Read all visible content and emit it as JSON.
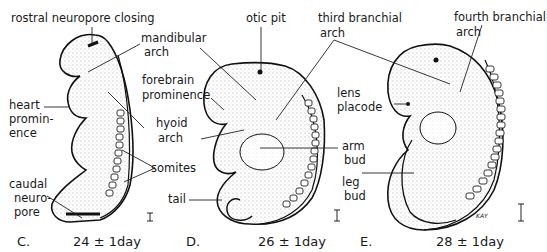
{
  "figure": {
    "panels": [
      {
        "id": "C",
        "letter": "C.",
        "age": "24 ± 1day",
        "labels": {
          "rostral_neuropore": "rostral neuropore closing",
          "mandibular_1": "mandibular",
          "mandibular_2": "arch",
          "forebrain_1": "forebrain",
          "forebrain_2": "prominence",
          "heart_1": "heart",
          "heart_2": "promin-",
          "heart_3": "ence",
          "hyoid_1": "hyoid",
          "hyoid_2": "arch",
          "somites": "somites",
          "caudal_1": "caudal",
          "caudal_2": "neuro-",
          "caudal_3": "pore"
        }
      },
      {
        "id": "D",
        "letter": "D.",
        "age": "26 ± 1day",
        "labels": {
          "otic_pit": "otic pit",
          "third_branchial_1": "third branchial",
          "third_branchial_2": "arch",
          "arm_1": "arm",
          "arm_2": "bud",
          "tail": "tail"
        }
      },
      {
        "id": "E",
        "letter": "E.",
        "age": "28 ± 1day",
        "labels": {
          "fourth_branchial_1": "fourth branchial",
          "fourth_branchial_2": "arch",
          "lens_1": "lens",
          "lens_2": "placode",
          "leg_1": "leg",
          "leg_2": "bud",
          "signature": "KAY"
        }
      }
    ]
  }
}
